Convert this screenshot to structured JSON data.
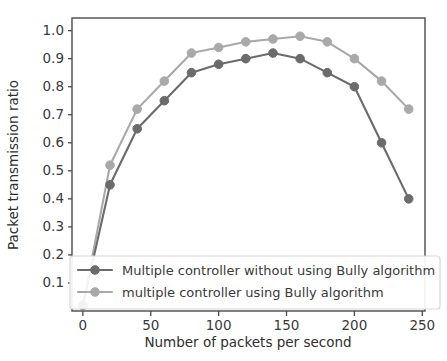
{
  "chart_data": {
    "type": "line",
    "title": "",
    "xlabel": "Number of packets per second",
    "ylabel": "Packet transmission ratio",
    "xlim": [
      -8,
      252
    ],
    "ylim": [
      0.0,
      1.045
    ],
    "grid": false,
    "legend_position": "lower center",
    "x": [
      0,
      20,
      40,
      60,
      80,
      100,
      120,
      140,
      160,
      180,
      200,
      220,
      240
    ],
    "xticks": [
      0,
      50,
      100,
      150,
      200,
      250
    ],
    "xticklabels": [
      "0",
      "50",
      "100",
      "150",
      "200",
      "250"
    ],
    "yticks": [
      0.1,
      0.2,
      0.3,
      0.4,
      0.5,
      0.6,
      0.7,
      0.8,
      0.9,
      1.0
    ],
    "yticklabels": [
      "0.1",
      "0.2",
      "0.3",
      "0.4",
      "0.5",
      "0.6",
      "0.7",
      "0.8",
      "0.9",
      "1.0"
    ],
    "series": [
      {
        "name": "Multiple controller without using Bully algorithm",
        "color": "#6b6b6b",
        "marker": "circle",
        "values": [
          0.02,
          0.45,
          0.65,
          0.75,
          0.85,
          0.88,
          0.9,
          0.92,
          0.9,
          0.85,
          0.8,
          0.6,
          0.4
        ]
      },
      {
        "name": "multiple controller using Bully algorithm",
        "color": "#a9a9a9",
        "marker": "circle",
        "values": [
          0.02,
          0.52,
          0.72,
          0.82,
          0.92,
          0.94,
          0.96,
          0.97,
          0.98,
          0.96,
          0.9,
          0.82,
          0.72
        ]
      }
    ]
  },
  "axes": {
    "xlabel": "Number of packets per second",
    "ylabel": "Packet transmission ratio"
  },
  "legend": {
    "entries": [
      {
        "label": "Multiple controller without using Bully algorithm",
        "color": "#6b6b6b"
      },
      {
        "label": "multiple controller using Bully algorithm",
        "color": "#a9a9a9"
      }
    ]
  },
  "ticks": {
    "x": [
      "0",
      "50",
      "100",
      "150",
      "200",
      "250"
    ],
    "y": [
      "0.1",
      "0.2",
      "0.3",
      "0.4",
      "0.5",
      "0.6",
      "0.7",
      "0.8",
      "0.9",
      "1.0"
    ]
  }
}
